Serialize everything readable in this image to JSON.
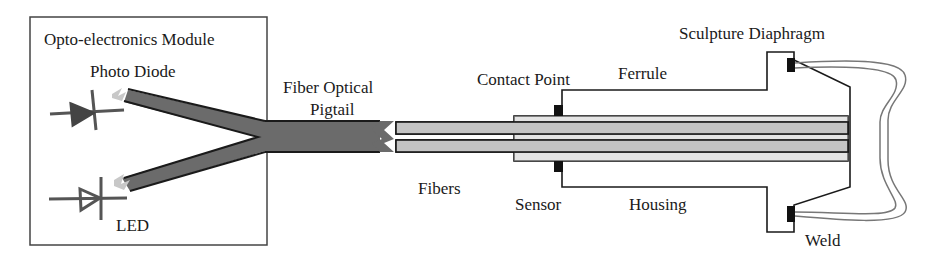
{
  "diagram": {
    "labels": {
      "module": "Opto-electronics Module",
      "photo_diode": "Photo Diode",
      "led": "LED",
      "pigtail_line1": "Fiber Optical",
      "pigtail_line2": "Pigtail",
      "fibers": "Fibers",
      "contact_point": "Contact Point",
      "ferrule": "Ferrule",
      "sensor": "Sensor",
      "housing": "Housing",
      "diaphragm": "Sculpture Diaphragm",
      "weld": "Weld"
    },
    "colors": {
      "outline": "#1a1a1a",
      "pigtail_fill": "#6b6b6b",
      "fiber_fill": "#c4c4c4",
      "light_arrow": "#bdbdbd",
      "diode": "#555555",
      "weld": "#111111",
      "diaphragm_stroke": "#777777"
    }
  }
}
